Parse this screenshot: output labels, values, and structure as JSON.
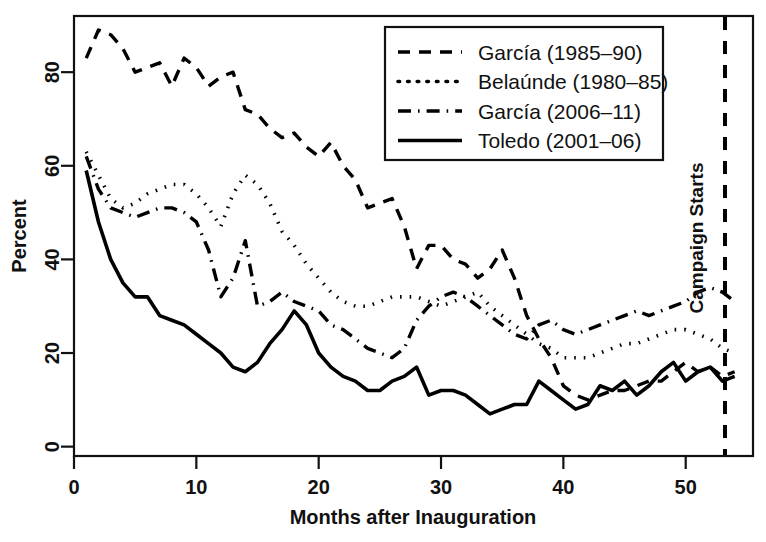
{
  "chart_data": {
    "type": "line",
    "title": "",
    "xlabel": "Months after Inauguration",
    "ylabel": "Percent",
    "xlim": [
      0,
      55.5
    ],
    "ylim": [
      -2,
      92
    ],
    "xticks": [
      0,
      10,
      20,
      30,
      40,
      50
    ],
    "yticks": [
      0,
      20,
      40,
      60,
      80
    ],
    "grid": false,
    "legend_position": "top-center-right",
    "annotations": [
      {
        "text": "Campaign Starts",
        "x": 54,
        "orientation": "vertical",
        "marker": "dashed-vertical-line"
      }
    ],
    "series": [
      {
        "name": "García (1985–90)",
        "dash": "dashed",
        "x": [
          1,
          2,
          3,
          4,
          5,
          6,
          7,
          8,
          9,
          10,
          11,
          12,
          13,
          14,
          15,
          16,
          17,
          18,
          19,
          20,
          21,
          22,
          23,
          24,
          25,
          26,
          27,
          28,
          29,
          30,
          31,
          32,
          33,
          34,
          35,
          36,
          37,
          38,
          39,
          40,
          41,
          42,
          43,
          44,
          45,
          46,
          47,
          48,
          49,
          50,
          51,
          52,
          53,
          54
        ],
        "y": [
          83,
          89,
          88,
          85,
          80,
          81,
          82,
          77,
          83,
          81,
          77,
          79,
          80,
          72,
          71,
          68,
          66,
          67,
          64,
          62,
          65,
          60,
          57,
          51,
          52,
          53,
          47,
          38,
          43,
          43,
          40,
          39,
          36,
          38,
          42,
          36,
          28,
          23,
          19,
          13,
          11,
          10,
          11,
          12,
          12,
          13,
          14,
          14,
          16,
          18,
          16,
          17,
          15,
          16
        ]
      },
      {
        "name": "Belaúnde (1980–85)",
        "dash": "dotted",
        "x": [
          1,
          2,
          3,
          4,
          5,
          6,
          7,
          8,
          9,
          10,
          11,
          12,
          13,
          14,
          15,
          16,
          17,
          18,
          19,
          20,
          21,
          22,
          23,
          24,
          25,
          26,
          27,
          28,
          29,
          30,
          31,
          32,
          33,
          34,
          35,
          36,
          37,
          38,
          39,
          40,
          41,
          42,
          43,
          44,
          45,
          46,
          47,
          48,
          49,
          50,
          51,
          52,
          53,
          54
        ],
        "y": [
          63,
          58,
          53,
          51,
          52,
          54,
          55,
          56,
          56,
          54,
          51,
          47,
          54,
          58,
          56,
          52,
          46,
          43,
          39,
          36,
          33,
          31,
          30,
          30,
          31,
          32,
          32,
          32,
          31,
          30,
          31,
          32,
          33,
          30,
          28,
          26,
          24,
          22,
          21,
          19,
          19,
          19,
          20,
          21,
          22,
          22,
          23,
          24,
          25,
          25,
          24,
          23,
          21,
          20
        ]
      },
      {
        "name": "García (2006–11)",
        "dash": "dashdot",
        "x": [
          1,
          2,
          3,
          4,
          5,
          6,
          7,
          8,
          9,
          10,
          11,
          12,
          13,
          14,
          15,
          16,
          17,
          18,
          19,
          20,
          21,
          22,
          23,
          24,
          25,
          26,
          27,
          28,
          29,
          30,
          31,
          32,
          33,
          34,
          35,
          36,
          37,
          38,
          39,
          40,
          41,
          42,
          43,
          44,
          45,
          46,
          47,
          48,
          49,
          50,
          51,
          52,
          53,
          54
        ],
        "y": [
          62,
          55,
          51,
          50,
          49,
          50,
          51,
          51,
          50,
          48,
          42,
          32,
          36,
          44,
          30,
          31,
          33,
          31,
          30,
          29,
          26,
          25,
          23,
          21,
          20,
          19,
          21,
          27,
          30,
          32,
          33,
          32,
          30,
          28,
          26,
          24,
          23,
          26,
          27,
          25,
          24,
          25,
          26,
          27,
          28,
          29,
          28,
          29,
          30,
          31,
          33,
          34,
          33,
          31
        ]
      },
      {
        "name": "Toledo (2001–06)",
        "dash": "solid",
        "x": [
          1,
          2,
          3,
          4,
          5,
          6,
          7,
          8,
          9,
          10,
          11,
          12,
          13,
          14,
          15,
          16,
          17,
          18,
          19,
          20,
          21,
          22,
          23,
          24,
          25,
          26,
          27,
          28,
          29,
          30,
          31,
          32,
          33,
          34,
          35,
          36,
          37,
          38,
          39,
          40,
          41,
          42,
          43,
          44,
          45,
          46,
          47,
          48,
          49,
          50,
          51,
          52,
          53,
          54
        ],
        "y": [
          59,
          48,
          40,
          35,
          32,
          32,
          28,
          27,
          26,
          24,
          22,
          20,
          17,
          16,
          18,
          22,
          25,
          29,
          26,
          20,
          17,
          15,
          14,
          12,
          12,
          14,
          15,
          17,
          11,
          12,
          12,
          11,
          9,
          7,
          8,
          9,
          9,
          14,
          12,
          10,
          8,
          9,
          13,
          12,
          14,
          11,
          13,
          16,
          18,
          14,
          16,
          17,
          14,
          15
        ]
      }
    ]
  },
  "axes": {
    "y_title": "Percent",
    "x_title": "Months after Inauguration",
    "y_tick_labels": [
      "0",
      "20",
      "40",
      "60",
      "80"
    ],
    "x_tick_labels": [
      "0",
      "10",
      "20",
      "30",
      "40",
      "50"
    ]
  },
  "legend": {
    "entries": [
      {
        "label": "García (1985–90)",
        "style": "dashed"
      },
      {
        "label": "Belaúnde (1980–85)",
        "style": "dotted"
      },
      {
        "label": "García (2006–11)",
        "style": "dashdot"
      },
      {
        "label": "Toledo (2001–06)",
        "style": "solid"
      }
    ]
  },
  "annotation": {
    "campaign_starts": "Campaign Starts"
  },
  "colors": {
    "line": "#000000",
    "axis": "#111111",
    "background": "#ffffff"
  }
}
